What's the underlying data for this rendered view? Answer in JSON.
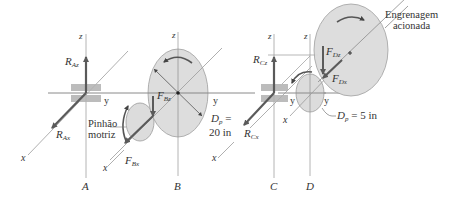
{
  "figure": {
    "colors": {
      "line": "#8a8a8a",
      "axis": "#b4b4b4",
      "arrow": "#5a5a5a",
      "gear_fill": "#dcdcdc",
      "gear_stroke": "#9a9a9a",
      "bearing": "#a8a8a8"
    },
    "supports": [
      {
        "id": "A",
        "label": "A"
      },
      {
        "id": "B",
        "label": "B"
      },
      {
        "id": "C",
        "label": "C"
      },
      {
        "id": "D",
        "label": "D"
      }
    ],
    "axes": {
      "z": "z",
      "y": "y",
      "x": "x"
    },
    "forces": {
      "RAz": {
        "sym": "R",
        "sub": "Az"
      },
      "RAx": {
        "sym": "R",
        "sub": "Ax"
      },
      "FBz": {
        "sym": "F",
        "sub": "Bz"
      },
      "FBx": {
        "sym": "F",
        "sub": "Bx"
      },
      "RCz": {
        "sym": "R",
        "sub": "Cz"
      },
      "RCx": {
        "sym": "R",
        "sub": "Cx"
      },
      "FDz": {
        "sym": "F",
        "sub": "Dz"
      },
      "FDx": {
        "sym": "F",
        "sub": "Dx"
      }
    },
    "dimensions": {
      "gear_B": {
        "sym": "D",
        "sub": "p",
        "eq": "=",
        "value": "20 in"
      },
      "gear_D": {
        "sym": "D",
        "sub": "p",
        "eq": "= 5 in"
      }
    },
    "notes": {
      "pinion_line1": "Pinhão",
      "pinion_line2": "motriz",
      "driven_line1": "Engrenagem",
      "driven_line2": "acionada"
    }
  }
}
